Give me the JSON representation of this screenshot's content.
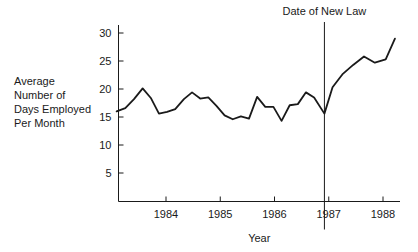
{
  "chart_data": {
    "type": "line",
    "title": "",
    "subtitle": "",
    "xlabel": "Year",
    "ylabel": "Average Number of Days Employed Per Month",
    "ylabel_lines": [
      "Average",
      "Number of",
      "Days Employed",
      "Per Month"
    ],
    "xlim": [
      1983.05,
      1988.35
    ],
    "ylim": [
      0,
      32
    ],
    "yticks": [
      5,
      10,
      15,
      20,
      25,
      30
    ],
    "ytick_labels": [
      "5",
      "10",
      "15",
      "20",
      "25",
      "30"
    ],
    "xticks": [
      1984,
      1985,
      1986,
      1987,
      1988
    ],
    "xtick_labels": [
      "1984",
      "1985",
      "1986",
      "1987",
      "1988"
    ],
    "grid": false,
    "legend": false,
    "legend_position": "none",
    "line_color": "#1a1a1a",
    "line_width": 1.8,
    "annotations": [
      {
        "name": "date-of-new-law",
        "label": "Date of New Law",
        "type": "vertical-line",
        "x": 1986.92,
        "label_x": 1986.92,
        "label_y": 31.8
      }
    ],
    "series": [
      {
        "name": "Average Number of Days Employed Per Month",
        "x": [
          1983.09,
          1983.25,
          1983.41,
          1983.57,
          1983.72,
          1983.87,
          1984.02,
          1984.17,
          1984.33,
          1984.48,
          1984.63,
          1984.78,
          1984.93,
          1985.08,
          1985.23,
          1985.38,
          1985.53,
          1985.68,
          1985.83,
          1985.98,
          1986.13,
          1986.28,
          1986.43,
          1986.58,
          1986.73,
          1986.92,
          1987.07,
          1987.25,
          1987.45,
          1987.65,
          1987.85,
          1988.05,
          1988.22
        ],
        "values": [
          16.0,
          16.6,
          18.2,
          20.1,
          18.4,
          15.6,
          15.9,
          16.4,
          18.2,
          19.4,
          18.3,
          18.5,
          17.0,
          15.3,
          14.6,
          15.1,
          14.7,
          18.6,
          16.8,
          16.8,
          14.3,
          17.1,
          17.3,
          19.4,
          18.5,
          15.6,
          20.3,
          22.6,
          24.3,
          25.8,
          24.7,
          25.3,
          29.0
        ]
      }
    ]
  }
}
